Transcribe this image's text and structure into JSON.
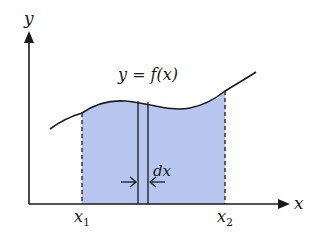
{
  "diagram": {
    "type": "integral-area-under-curve",
    "colors": {
      "fill": "#b7c6ee",
      "stroke": "#1a1a1a",
      "background": "#ffffff"
    },
    "labels": {
      "y_axis": "y",
      "x_axis": "x",
      "function": "y = f(x)",
      "x1_main": "x",
      "x1_sub": "1",
      "x2_main": "x",
      "x2_sub": "2",
      "strip_width": "dx"
    }
  }
}
